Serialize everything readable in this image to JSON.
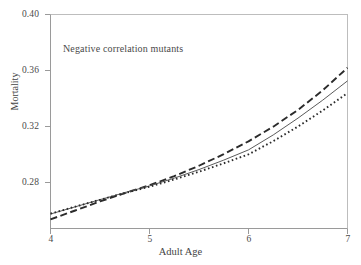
{
  "chart_data": {
    "type": "line",
    "title": "",
    "annotation": "Negative correlation mutants",
    "xlabel": "Adult Age",
    "ylabel": "Mortality",
    "xlim": [
      4,
      7
    ],
    "ylim": [
      0.2595,
      0.4
    ],
    "grid": false,
    "legend": "none",
    "xticks": [
      4,
      5,
      6,
      7
    ],
    "xtick_labels": [
      "4",
      "5",
      "6",
      "7"
    ],
    "yticks": [
      0.28,
      0.32,
      0.36,
      0.4
    ],
    "ytick_labels": [
      "0.28",
      "0.32",
      "0.36",
      "0.40"
    ],
    "series": [
      {
        "name": "dashed",
        "style": "dashed",
        "color": "#2b2b2b",
        "x": [
          4.0,
          4.25,
          4.5,
          4.75,
          5.0,
          5.25,
          5.5,
          5.75,
          6.0,
          6.25,
          6.5,
          6.75,
          7.0
        ],
        "values": [
          0.2655,
          0.2713,
          0.2772,
          0.2827,
          0.2878,
          0.2938,
          0.3006,
          0.3082,
          0.3166,
          0.3262,
          0.3372,
          0.35,
          0.3648
        ]
      },
      {
        "name": "solid",
        "style": "solid",
        "color": "#5a5a5a",
        "x": [
          4.0,
          4.25,
          4.5,
          4.75,
          5.0,
          5.25,
          5.5,
          5.75,
          6.0,
          6.25,
          6.5,
          6.75,
          7.0
        ],
        "values": [
          0.269,
          0.2737,
          0.2784,
          0.283,
          0.2874,
          0.2925,
          0.2981,
          0.3043,
          0.311,
          0.3208,
          0.3318,
          0.3436,
          0.3562
        ]
      },
      {
        "name": "dotted",
        "style": "dotted",
        "color": "#2b2b2b",
        "x": [
          4.0,
          4.25,
          4.5,
          4.75,
          5.0,
          5.25,
          5.5,
          5.75,
          6.0,
          6.25,
          6.5,
          6.75,
          7.0
        ],
        "values": [
          0.2692,
          0.2738,
          0.2783,
          0.2827,
          0.2869,
          0.2916,
          0.2967,
          0.3022,
          0.3081,
          0.3167,
          0.3263,
          0.3368,
          0.3482
        ]
      }
    ]
  },
  "axis_titles": {
    "x": "Adult Age",
    "y": "Mortality"
  },
  "annotation_text": "Negative correlation mutants",
  "colors": {
    "axis": "#9a9a9a",
    "text": "#4a4a4a",
    "dashed_line": "#2b2b2b",
    "solid_line": "#5a5a5a",
    "dotted_line": "#2b2b2b",
    "background": "#ffffff"
  }
}
